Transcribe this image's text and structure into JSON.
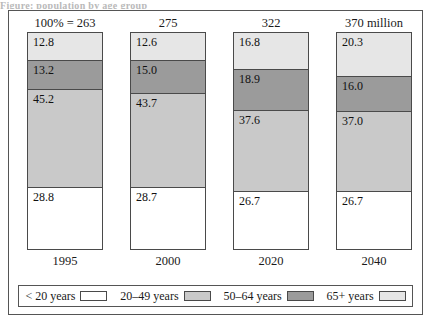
{
  "top_caption": "Figure: population by age group",
  "chart_data": {
    "type": "bar",
    "subtype": "stacked-100-percent",
    "title": "",
    "subtitle": "",
    "xlabel": "",
    "ylabel": "",
    "ylim": [
      0,
      100
    ],
    "grid": false,
    "legend_position": "bottom",
    "categories": [
      "1995",
      "2000",
      "2020",
      "2040"
    ],
    "totals_prefix": "100% = ",
    "totals": [
      "263",
      "275",
      "322",
      "370 million"
    ],
    "series": [
      {
        "name": "< 20 years",
        "color": "#ffffff",
        "values": [
          28.8,
          28.7,
          26.7,
          26.7
        ]
      },
      {
        "name": "20–49 years",
        "color": "#c9c9c9",
        "values": [
          45.2,
          43.7,
          37.6,
          37.0
        ]
      },
      {
        "name": "50–64 years",
        "color": "#9b9b9b",
        "values": [
          13.2,
          15.0,
          18.9,
          16.0
        ]
      },
      {
        "name": "65+ years",
        "color": "#e6e6e6",
        "values": [
          12.8,
          12.6,
          16.8,
          20.3
        ]
      }
    ],
    "stack_order_bottom_to_top": [
      "< 20 years",
      "20–49 years",
      "50–64 years",
      "65+ years"
    ]
  },
  "totals_labels": [
    {
      "text": "100% = 263"
    },
    {
      "text": "275"
    },
    {
      "text": "322"
    },
    {
      "text": "370 million"
    }
  ],
  "bars": [
    {
      "category": "1995",
      "segments": [
        {
          "name": "65+ years",
          "value": "12.8",
          "swatch": "sw-65p"
        },
        {
          "name": "50–64 years",
          "value": "13.2",
          "swatch": "sw-5064"
        },
        {
          "name": "20–49 years",
          "value": "45.2",
          "swatch": "sw-2049"
        },
        {
          "name": "< 20 years",
          "value": "28.8",
          "swatch": "sw-u20"
        }
      ]
    },
    {
      "category": "2000",
      "segments": [
        {
          "name": "65+ years",
          "value": "12.6",
          "swatch": "sw-65p"
        },
        {
          "name": "50–64 years",
          "value": "15.0",
          "swatch": "sw-5064"
        },
        {
          "name": "20–49 years",
          "value": "43.7",
          "swatch": "sw-2049"
        },
        {
          "name": "< 20 years",
          "value": "28.7",
          "swatch": "sw-u20"
        }
      ]
    },
    {
      "category": "2020",
      "segments": [
        {
          "name": "65+ years",
          "value": "16.8",
          "swatch": "sw-65p"
        },
        {
          "name": "50–64 years",
          "value": "18.9",
          "swatch": "sw-5064"
        },
        {
          "name": "20–49 years",
          "value": "37.6",
          "swatch": "sw-2049"
        },
        {
          "name": "< 20 years",
          "value": "26.7",
          "swatch": "sw-u20"
        }
      ]
    },
    {
      "category": "2040",
      "segments": [
        {
          "name": "65+ years",
          "value": "20.3",
          "swatch": "sw-65p"
        },
        {
          "name": "50–64 years",
          "value": "16.0",
          "swatch": "sw-5064"
        },
        {
          "name": "20–49 years",
          "value": "37.0",
          "swatch": "sw-2049"
        },
        {
          "name": "< 20 years",
          "value": "26.7",
          "swatch": "sw-u20"
        }
      ]
    }
  ],
  "category_labels": [
    "1995",
    "2000",
    "2020",
    "2040"
  ],
  "legend": [
    {
      "label": "< 20 years",
      "swatch": "sw-u20"
    },
    {
      "label": "20–49 years",
      "swatch": "sw-2049"
    },
    {
      "label": "50–64 years",
      "swatch": "sw-5064"
    },
    {
      "label": "65+ years",
      "swatch": "sw-65p"
    }
  ]
}
